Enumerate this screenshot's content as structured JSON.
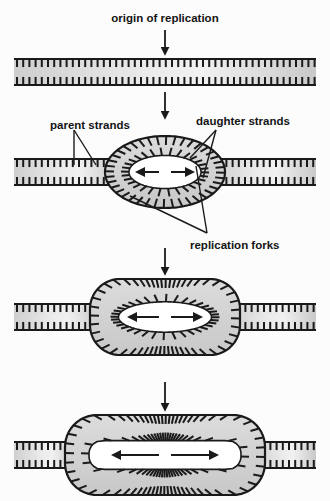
{
  "figure": {
    "background_color": "#fcfcfc",
    "strand_fill": "#d3d3d3",
    "strand_fill_light": "#ededed",
    "stroke_color": "#1a1a1a",
    "bubble_fill": "#d6d6d6",
    "opening_fill": "#ffffff"
  },
  "labels": {
    "origin": "origin of replication",
    "parent": "parent strands",
    "daughter": "daughter strands",
    "forks": "replication forks"
  },
  "stages": [
    {
      "id": "stage-1",
      "name": "unreplicated-duplex",
      "description": "intact parent DNA duplex",
      "center_y": 72,
      "bubble": null,
      "arrows": []
    },
    {
      "id": "stage-2",
      "name": "initiation-bubble",
      "description": "small replication bubble opened at the origin",
      "center_y": 172,
      "bubble": {
        "shape": "ellipse",
        "half_width": 60,
        "half_height": 36
      },
      "arrows": [
        "left",
        "right"
      ]
    },
    {
      "id": "stage-3",
      "name": "elongating-bubble",
      "description": "bubble enlarged as forks move apart",
      "center_y": 317,
      "bubble": {
        "shape": "stadium",
        "half_width": 75,
        "half_height": 38
      },
      "arrows": [
        "left",
        "right"
      ]
    },
    {
      "id": "stage-4",
      "name": "expanded-bubble",
      "description": "bubble expanded further with two daughter duplexes",
      "center_y": 455,
      "bubble": {
        "shape": "stadium",
        "half_width": 100,
        "half_height": 40
      },
      "arrows": [
        "left",
        "right"
      ]
    }
  ],
  "flow_arrows": [
    {
      "name": "origin-pointer",
      "from_y": 30,
      "to_y": 54,
      "x": 165
    },
    {
      "name": "stage1-to-stage2",
      "from_y": 92,
      "to_y": 118,
      "x": 165
    },
    {
      "name": "stage2-to-stage3",
      "from_y": 248,
      "to_y": 274,
      "x": 165
    },
    {
      "name": "stage3-to-stage4",
      "from_y": 382,
      "to_y": 410,
      "x": 165
    }
  ],
  "leaders": {
    "parent": [
      {
        "from": [
          74,
          130
        ],
        "to": [
          74,
          165
        ]
      },
      {
        "from": [
          74,
          130
        ],
        "to": [
          96,
          165
        ]
      }
    ],
    "daughter": [
      {
        "from": [
          216,
          130
        ],
        "to": [
          190,
          158
        ]
      },
      {
        "from": [
          216,
          130
        ],
        "to": [
          203,
          178
        ]
      }
    ],
    "forks": [
      {
        "from": [
          207,
          233
        ],
        "to": [
          130,
          196
        ]
      },
      {
        "from": [
          207,
          233
        ],
        "to": [
          196,
          166
        ]
      }
    ]
  }
}
